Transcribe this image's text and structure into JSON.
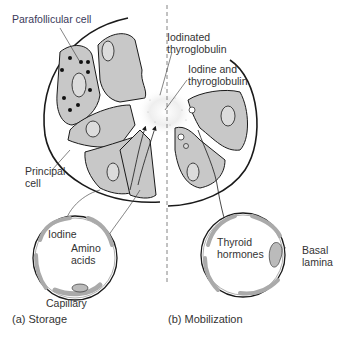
{
  "figure": {
    "panels": [
      {
        "id": "a",
        "caption": "(a) Storage"
      },
      {
        "id": "b",
        "caption": "(b) Mobilization"
      }
    ],
    "labels": {
      "parafollicular_cell": "Parafollicular cell",
      "iodinated_thyroglobulin_1": "Iodinated",
      "iodinated_thyroglobulin_2": "thyroglobulin",
      "iodine_and_thyroglobulin_1": "Iodine and",
      "iodine_and_thyroglobulin_2": "thyroglobulin",
      "principal_cell_1": "Principal",
      "principal_cell_2": "cell",
      "iodine": "Iodine",
      "amino_acids_1": "Amino",
      "amino_acids_2": "acids",
      "capillary": "Capillary",
      "thyroid_hormones_1": "Thyroid",
      "thyroid_hormones_2": "hormones",
      "basal_lamina_1": "Basal",
      "basal_lamina_2": "lamina"
    },
    "colors": {
      "cell_fill": "#c8c8c8",
      "outline": "#1a1a1a",
      "text": "#333333",
      "colloid": "#e6e6e6"
    }
  }
}
